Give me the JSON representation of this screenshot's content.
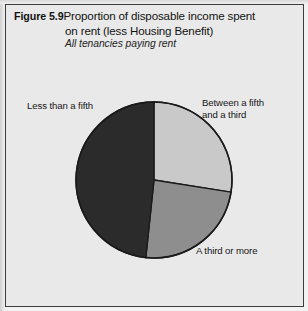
{
  "figure": {
    "number": "Figure 5.9",
    "title_line_1": "Proportion of disposable income spent",
    "title_line_2": "on rent (less Housing Benefit)",
    "subtitle": "All tenancies paying rent"
  },
  "colors": {
    "background": "#e9e9e9",
    "frame": "#3d3d3d",
    "slice_light": "#c9c9c9",
    "slice_medium": "#8e8e8e",
    "slice_dark": "#2b2b2b",
    "outline": "#1a1a1a",
    "text": "#161616"
  },
  "chart_data": {
    "type": "pie",
    "title": "Proportion of disposable income spent on rent (less Housing Benefit)",
    "subtitle": "All tenancies paying rent",
    "xlabel": "",
    "ylabel": "",
    "grid": false,
    "legend_position": "none",
    "labels_inline": true,
    "start_angle_deg": 0,
    "direction": "clockwise",
    "categories": [
      "Between a fifth and a third",
      "A third or more",
      "Less than a fifth"
    ],
    "values": [
      27.5,
      24.0,
      48.5
    ],
    "slices": [
      {
        "name": "Between a fifth and a third",
        "label_line_1": "Between a fifth",
        "label_line_2": "and a third",
        "value": 27.5,
        "start_deg": 0,
        "end_deg": 99,
        "color": "#c9c9c9"
      },
      {
        "name": "A third or more",
        "label_line_1": "A third or more",
        "label_line_2": "",
        "value": 24.0,
        "start_deg": 99,
        "end_deg": 186,
        "color": "#8e8e8e"
      },
      {
        "name": "Less than a fifth",
        "label_line_1": "Less than a fifth",
        "label_line_2": "",
        "value": 48.5,
        "start_deg": 186,
        "end_deg": 360,
        "color": "#2b2b2b"
      }
    ]
  },
  "labels": {
    "less_than_a_fifth": "Less than a fifth",
    "between_a_fifth_and_a_third": "Between a fifth\nand a third",
    "a_third_or_more": "A third or more"
  }
}
